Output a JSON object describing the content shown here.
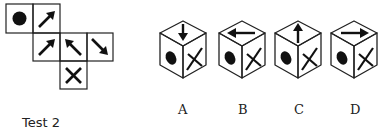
{
  "caption": "Test 2",
  "net": {
    "description": "Unfolded cube net with six faces",
    "faces": [
      {
        "row": 0,
        "col": 0,
        "symbol": "circle"
      },
      {
        "row": 0,
        "col": 1,
        "symbol": "arrow-up-right"
      },
      {
        "row": 1,
        "col": 1,
        "symbol": "arrow-up-right"
      },
      {
        "row": 1,
        "col": 2,
        "symbol": "arrow-up-left"
      },
      {
        "row": 1,
        "col": 3,
        "symbol": "arrow-down-right"
      },
      {
        "row": 2,
        "col": 2,
        "symbol": "cross"
      }
    ]
  },
  "options": [
    {
      "label": "A",
      "top": "arrow-down",
      "left": "circle",
      "right": "cross"
    },
    {
      "label": "B",
      "top": "arrow-left",
      "left": "circle",
      "right": "cross"
    },
    {
      "label": "C",
      "top": "arrow-up",
      "left": "circle",
      "right": "cross"
    },
    {
      "label": "D",
      "top": "arrow-right",
      "left": "circle",
      "right": "cross"
    }
  ],
  "colors": {
    "ink": "#111111",
    "background": "#ffffff"
  }
}
